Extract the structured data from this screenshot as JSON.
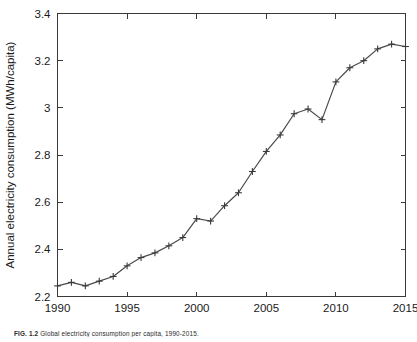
{
  "figure": {
    "caption_label": "FIG. 1.2",
    "caption_text": "Global electricity consumption per capita, 1990-2015."
  },
  "chart_data": {
    "type": "line",
    "title": "",
    "xlabel": "yyyy",
    "ylabel": "Annual electricity consumption (MWh/capita)",
    "xlim": [
      1990,
      2015
    ],
    "ylim": [
      2.2,
      3.4
    ],
    "xticks": [
      1990,
      1995,
      2000,
      2005,
      2010,
      2015
    ],
    "xtick_labels": [
      "1990",
      "1995",
      "2000",
      "2005",
      "2010",
      "2015"
    ],
    "yticks": [
      2.2,
      2.4,
      2.6,
      2.8,
      3.0,
      3.2,
      3.4
    ],
    "ytick_labels": [
      "2.2",
      "2.4",
      "2.6",
      "2.8",
      "3",
      "3.2",
      "3.4"
    ],
    "grid": false,
    "legend": false,
    "marker": "plus",
    "line_color": "#4a4a4a",
    "x": [
      1990,
      1991,
      1992,
      1993,
      1994,
      1995,
      1996,
      1997,
      1998,
      1999,
      2000,
      2001,
      2002,
      2003,
      2004,
      2005,
      2006,
      2007,
      2008,
      2009,
      2010,
      2011,
      2012,
      2013,
      2014,
      2015
    ],
    "values": [
      2.245,
      2.26,
      2.245,
      2.265,
      2.285,
      2.33,
      2.365,
      2.385,
      2.415,
      2.45,
      2.53,
      2.52,
      2.585,
      2.64,
      2.73,
      2.815,
      2.885,
      2.975,
      2.995,
      2.95,
      3.11,
      3.17,
      3.2,
      3.25,
      3.27,
      3.26
    ]
  }
}
